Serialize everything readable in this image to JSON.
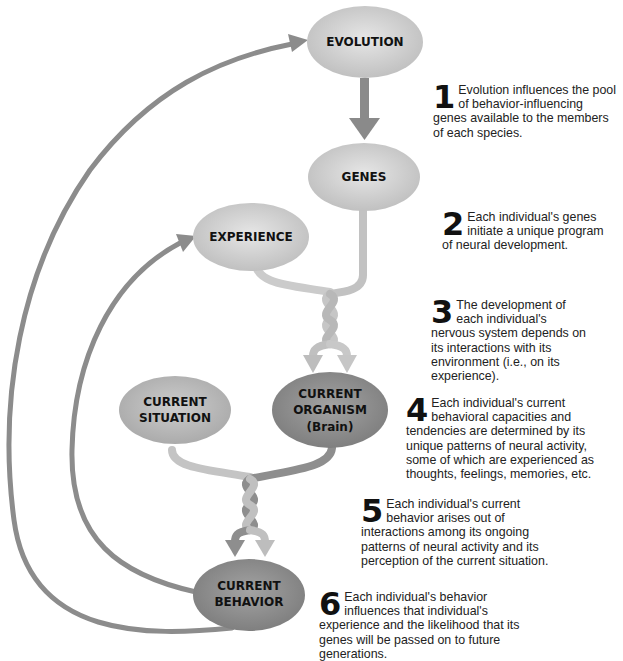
{
  "colors": {
    "background": "#ffffff",
    "node_light": "#d2d2d2",
    "node_dark": "#8d8d8d",
    "arrow_dark": "#8a8a8a",
    "strand_light": "#c4c4c4",
    "strand_dark": "#8f8f8f"
  },
  "nodes": {
    "evolution": {
      "label": "EVOLUTION"
    },
    "genes": {
      "label": "GENES"
    },
    "experience": {
      "label": "EXPERIENCE"
    },
    "current_situation": {
      "line1": "CURRENT",
      "line2": "SITUATION"
    },
    "current_organism": {
      "line1": "CURRENT",
      "line2": "ORGANISM",
      "line3": "(Brain)"
    },
    "current_behavior": {
      "line1": "CURRENT",
      "line2": "BEHAVIOR"
    }
  },
  "steps": [
    {
      "number": "1",
      "text": "Evolution influences the pool of behavior-influencing genes available to the members of each species."
    },
    {
      "number": "2",
      "text": "Each individual's genes initiate a unique program of neural development."
    },
    {
      "number": "3",
      "text": "The development of each individual's nervous system depends on its interactions with its environment (i.e., on its experience)."
    },
    {
      "number": "4",
      "text": "Each individual's current behavioral capacities and tendencies are determined by its unique patterns of neural activity, some of which are experienced as thoughts, feelings, memories, etc."
    },
    {
      "number": "5",
      "text": "Each individual's current behavior arises out of interactions among its ongoing patterns of neural activity and its perception of the current situation."
    },
    {
      "number": "6",
      "text": "Each individual's behavior influences that individual's experience and the likelihood that its genes will be passed on to future generations."
    }
  ]
}
